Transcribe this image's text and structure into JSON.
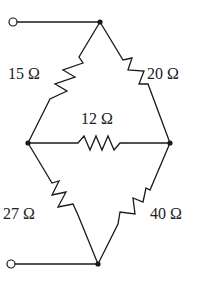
{
  "diagram": {
    "type": "resistor-bridge-circuit",
    "resistors": [
      {
        "id": "R_top_left",
        "label": "15 Ω",
        "value_ohms": 15,
        "between": [
          "top",
          "left"
        ]
      },
      {
        "id": "R_top_right",
        "label": "20 Ω",
        "value_ohms": 20,
        "between": [
          "top",
          "right"
        ]
      },
      {
        "id": "R_middle",
        "label": "12 Ω",
        "value_ohms": 12,
        "between": [
          "left",
          "right"
        ]
      },
      {
        "id": "R_bottom_left",
        "label": "27 Ω",
        "value_ohms": 27,
        "between": [
          "left",
          "bottom"
        ]
      },
      {
        "id": "R_bottom_right",
        "label": "40 Ω",
        "value_ohms": 40,
        "between": [
          "right",
          "bottom"
        ]
      }
    ],
    "nodes": [
      "top",
      "left",
      "right",
      "bottom"
    ],
    "terminals": [
      {
        "id": "terminal_a",
        "connects_to": "top"
      },
      {
        "id": "terminal_b",
        "connects_to": "bottom"
      }
    ]
  }
}
